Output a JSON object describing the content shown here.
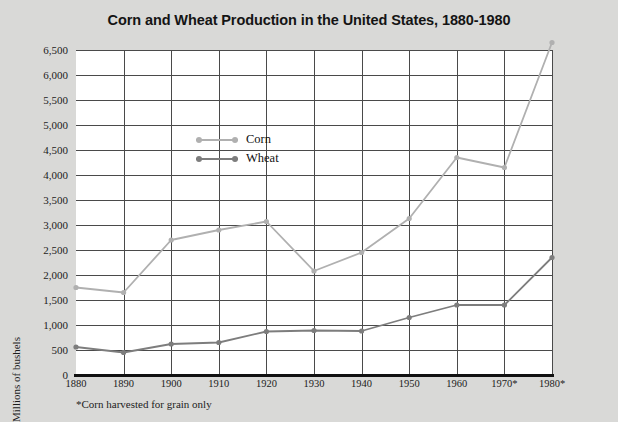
{
  "title": "Corn and Wheat Production in the United States, 1880-1980",
  "footnote": "*Corn harvested for grain only",
  "legend": {
    "items": [
      {
        "label": "Corn",
        "color": "#b0b0b0"
      },
      {
        "label": "Wheat",
        "color": "#7d7d7d"
      }
    ]
  },
  "colors": {
    "page_background": "#d9d9d7",
    "plot_background": "#ffffff",
    "gridline": "#4a4a4a",
    "axis": "#111111",
    "corn": "#b0b0b0",
    "wheat": "#7d7d7d"
  },
  "chart_data": {
    "type": "line",
    "title": "Corn and Wheat Production in the United States, 1880-1980",
    "xlabel": "",
    "ylabel": "Millions of bushels",
    "categories": [
      "1880",
      "1890",
      "1900",
      "1910",
      "1920",
      "1930",
      "1940",
      "1950",
      "1960",
      "1970*",
      "1980*"
    ],
    "x": [
      1880,
      1890,
      1900,
      1910,
      1920,
      1930,
      1940,
      1950,
      1960,
      1970,
      1980
    ],
    "ylim": [
      0,
      6500
    ],
    "ytick_labels": [
      "6,500",
      "6,000",
      "5,500",
      "5,000",
      "4,500",
      "4,000",
      "3,500",
      "3,000",
      "2,500",
      "2,000",
      "1,500",
      "1,000",
      "500",
      "0"
    ],
    "yticks": [
      6500,
      6000,
      5500,
      5000,
      4500,
      4000,
      3500,
      3000,
      2500,
      2000,
      1500,
      1000,
      500,
      0
    ],
    "grid": true,
    "legend_position": "upper-left-inside",
    "series": [
      {
        "name": "Corn",
        "color": "#b0b0b0",
        "values": [
          1750,
          1650,
          2700,
          2900,
          3070,
          2080,
          2450,
          3130,
          4350,
          4150,
          6650
        ]
      },
      {
        "name": "Wheat",
        "color": "#7d7d7d",
        "values": [
          560,
          450,
          620,
          650,
          870,
          890,
          880,
          1150,
          1400,
          1400,
          2350
        ]
      }
    ],
    "annotations": [
      "*Corn harvested for grain only"
    ]
  }
}
